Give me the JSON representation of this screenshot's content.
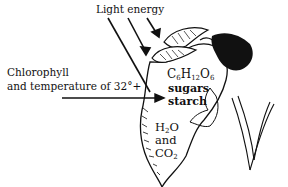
{
  "diagram": {
    "type": "illustration",
    "labels": {
      "light_energy": "Light energy",
      "chlorophyll_line1": "Chlorophyll",
      "chlorophyll_line2": "and temperature  of 32°+",
      "formula": {
        "c": "C",
        "c_sub": "6",
        "h": "H",
        "h_sub": "12",
        "o": "O",
        "o_sub": "6"
      },
      "sugars": "sugars",
      "starch": "starch",
      "water": {
        "h": "H",
        "h_sub": "2",
        "o": "O"
      },
      "and": "and",
      "carbon_dioxide": {
        "co": "CO",
        "sub": "2"
      }
    },
    "colors": {
      "ink": "#111111",
      "background": "#ffffff"
    }
  }
}
